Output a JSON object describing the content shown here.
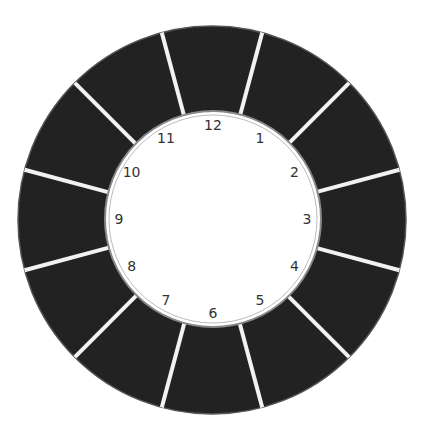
{
  "diagram": {
    "type": "clock-wheel",
    "segments": 12,
    "colors": {
      "ring": "#222222",
      "separator": "#f2f2f2",
      "face": "#ffffff",
      "text": "#333333"
    },
    "numbers": [
      "12",
      "1",
      "2",
      "3",
      "4",
      "5",
      "6",
      "7",
      "8",
      "9",
      "10",
      "11"
    ]
  }
}
